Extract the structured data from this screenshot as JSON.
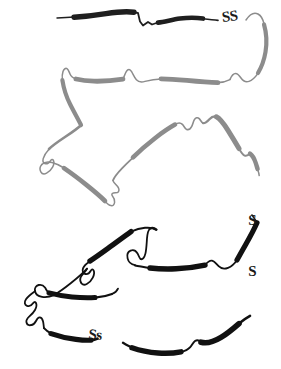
{
  "figure": {
    "background_color": "#ffffff",
    "width": 281,
    "height": 369
  },
  "labels": {
    "disulfide_1": "SS",
    "disulfide_2_top": "S",
    "disulfide_2_bottom": "S",
    "disulfide_3": "Ss"
  },
  "colors": {
    "chain_dark": "#1f1f1f",
    "chain_black": "#111111",
    "chain_gray": "#8c8c8c",
    "chain_midgray": "#6e6e6e",
    "label_color": "#1a1a1a"
  },
  "chains": [
    {
      "id": "chain-top",
      "name": "top-segment",
      "tone": "dark",
      "color": "#1f1f1f",
      "note": "Uppermost near-horizontal strand running left to right, ending at the first disulfide label."
    },
    {
      "id": "chain-upper-gray",
      "name": "upper-gray-segment",
      "tone": "gray",
      "color": "#8c8c8c",
      "note": "Second horizontal strand in medium gray, connected at the right by a descending curve."
    },
    {
      "id": "chain-middle-loop",
      "name": "middle-loop-segment",
      "tone": "gray",
      "color": "#8c8c8c",
      "note": "Large triangular loop occupying the centre of the figure, terminating at the second disulfide label."
    },
    {
      "id": "chain-lower-black",
      "name": "lower-black-segment",
      "tone": "black",
      "color": "#111111",
      "note": "Lower folded region drawn in solid black with thick helical segments."
    },
    {
      "id": "chain-bottom",
      "name": "bottom-segment",
      "tone": "black",
      "color": "#111111",
      "note": "Bottom-most strand passing through the third disulfide label and rising to the right."
    }
  ],
  "annotations": [
    {
      "name": "disulfide-bridge-1",
      "text": "SS",
      "x": 221,
      "y": 10,
      "orientation": "horizontal"
    },
    {
      "name": "disulfide-bridge-2",
      "text": "S S",
      "x": 245,
      "y": 178,
      "orientation": "vertical"
    },
    {
      "name": "disulfide-bridge-3",
      "text": "Ss",
      "x": 89,
      "y": 327,
      "orientation": "horizontal"
    }
  ]
}
